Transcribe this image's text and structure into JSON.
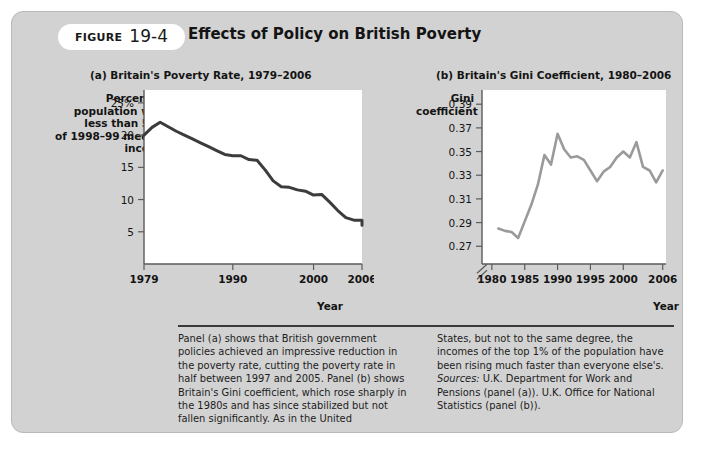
{
  "figure": {
    "badge_word": "FIGURE",
    "badge_number": "19-4",
    "title": "Effects of Policy on British Poverty"
  },
  "panel_a": {
    "title": "(a) Britain's Poverty Rate, 1979–2006",
    "y_axis_label": "Percent of\npopulation with\nless than 50%\nof 1998–99 median\nincome",
    "x_axis_label": "Year"
  },
  "panel_b": {
    "title": "(b) Britain's Gini Coefficient, 1980–2006",
    "y_axis_label": "Gini\ncoefficient",
    "x_axis_label": "Year"
  },
  "caption": {
    "left": "Panel (a) shows that British government policies achieved an impressive reduction in the poverty rate, cutting the poverty rate in half between 1997 and 2005. Panel (b) shows Britain's Gini coefficient, which rose sharply in the 1980s and has since stabilized but not fallen significantly. As in the United",
    "right": "States, but not to the same degree, the incomes of the top 1% of the population have been rising much faster than everyone else's.",
    "sources_word": "Sources:",
    "sources_text": " U.K. Department for Work and Pensions (panel (a)). U.K. Office for National Statistics (panel (b))."
  },
  "colors": {
    "card_background": "#d2d2d2",
    "plot_background": "#ffffff",
    "line_a": "#3c3c3c",
    "line_b": "#9a9a9a",
    "axis": "#5a5a5a",
    "text": "#141414",
    "rule": "#3a3a3a"
  },
  "chart_data": [
    {
      "type": "line",
      "panel": "a",
      "title": "(a) Britain's Poverty Rate, 1979–2006",
      "xlabel": "Year",
      "ylabel": "Percent of population with less than 50% of 1998–99 median income",
      "xlim": [
        1979,
        2006
      ],
      "ylim": [
        0,
        27
      ],
      "xticks": [
        1979,
        1990,
        2000,
        2006
      ],
      "xticklabels": [
        "1979",
        "1990",
        "2000",
        "2006"
      ],
      "yticks": [
        5,
        10,
        15,
        20,
        25
      ],
      "yticklabels": [
        "5",
        "10",
        "15",
        "20",
        "25%"
      ],
      "grid": false,
      "legend": false,
      "x": [
        1979,
        1980,
        1981,
        1982,
        1983,
        1984,
        1985,
        1986,
        1987,
        1988,
        1989,
        1990,
        1991,
        1992,
        1993,
        1994,
        1995,
        1996,
        1997,
        1998,
        1999,
        2000,
        2001,
        2002,
        2003,
        2004,
        2005,
        2006
      ],
      "values": [
        20.0,
        21.2,
        22.0,
        21.3,
        20.6,
        20.0,
        19.4,
        18.8,
        18.2,
        17.6,
        17.0,
        16.8,
        16.8,
        16.2,
        16.1,
        14.6,
        12.9,
        12.0,
        11.9,
        11.5,
        11.3,
        10.7,
        10.8,
        9.6,
        8.3,
        7.2,
        6.8,
        6.8
      ],
      "late_tail": {
        "x": [
          2006.5,
          2007.0
        ],
        "values": [
          6.0,
          6.7
        ]
      }
    },
    {
      "type": "line",
      "panel": "b",
      "title": "(b) Britain's Gini Coefficient, 1980–2006",
      "xlabel": "Year",
      "ylabel": "Gini coefficient",
      "xlim": [
        1978.5,
        2006.5
      ],
      "ylim": [
        0.255,
        0.402
      ],
      "axis_break": true,
      "xticks": [
        1980,
        1985,
        1990,
        1995,
        2000,
        2006
      ],
      "xticklabels": [
        "1980",
        "1985",
        "1990",
        "1995",
        "2000",
        "2006"
      ],
      "yticks": [
        0.27,
        0.29,
        0.31,
        0.33,
        0.35,
        0.37,
        0.39
      ],
      "yticklabels": [
        "0.27",
        "0.29",
        "0.31",
        "0.33",
        "0.35",
        "0.37",
        "0.39"
      ],
      "grid": false,
      "legend": false,
      "x": [
        1981,
        1982,
        1983,
        1984,
        1985,
        1986,
        1987,
        1988,
        1989,
        1990,
        1991,
        1992,
        1993,
        1994,
        1995,
        1996,
        1997,
        1998,
        1999,
        2000,
        2001,
        2002,
        2003,
        2004,
        2005,
        2006
      ],
      "values": [
        0.285,
        0.283,
        0.282,
        0.277,
        0.291,
        0.305,
        0.322,
        0.347,
        0.339,
        0.365,
        0.352,
        0.345,
        0.346,
        0.343,
        0.334,
        0.325,
        0.333,
        0.337,
        0.345,
        0.35,
        0.345,
        0.358,
        0.337,
        0.334,
        0.324,
        0.334
      ]
    }
  ]
}
